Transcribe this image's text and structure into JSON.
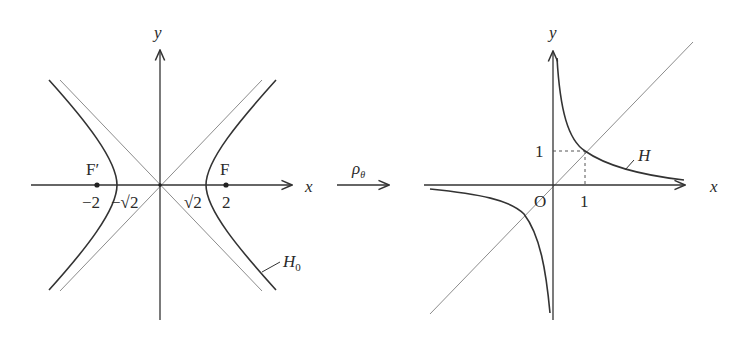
{
  "left_figure": {
    "title": "H0: x^2 - y^2 = 2",
    "axis_x_label": "x",
    "axis_y_label": "y",
    "curve_label": "H",
    "curve_label_sub": "0",
    "focus_right_label": "F",
    "focus_left_label": "F′",
    "ticks": {
      "neg_two": "−2",
      "neg_sqrt2": "−√2",
      "sqrt2": "√2",
      "two": "2"
    },
    "foci": [
      [
        -2,
        0
      ],
      [
        2,
        0
      ]
    ],
    "vertices": [
      [
        -1.414,
        0
      ],
      [
        1.414,
        0
      ]
    ],
    "asymptotes": [
      "y = x",
      "y = -x"
    ]
  },
  "transform": {
    "label": "ρ",
    "label_sub": "θ"
  },
  "right_figure": {
    "title": "H: xy = 1",
    "axis_x_label": "x",
    "axis_y_label": "y",
    "curve_label": "H",
    "origin_label": "O",
    "tick_x": "1",
    "tick_y": "1",
    "marked_point": [
      1,
      1
    ],
    "line": "y = x"
  },
  "colors": {
    "curve": "#333333",
    "axis": "#333333",
    "asymptote": "#8c8c8c",
    "background": "#ffffff"
  }
}
